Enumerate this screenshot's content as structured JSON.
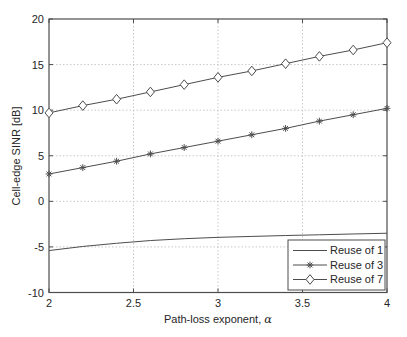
{
  "colors": {
    "background": "#ffffff",
    "line": "#4d4d4d",
    "axis": "#4d4d4d",
    "grid": "#c9c9c9",
    "text": "#262626"
  },
  "axes": {
    "xlabel_text": "Path-loss exponent,",
    "xlabel_symbol": "α",
    "ylabel": "Cell-edge SINR [dB]"
  },
  "legend": {
    "entries": [
      "Reuse of 1",
      "Reuse of 3",
      "Reuse of 7"
    ]
  },
  "chart_data": {
    "type": "line",
    "title": "",
    "xlabel": "Path-loss exponent, α",
    "ylabel": "Cell-edge SINR [dB]",
    "xlim": [
      2,
      4
    ],
    "ylim": [
      -10,
      20
    ],
    "x_tick_values": [
      2,
      2.5,
      3,
      3.5,
      4
    ],
    "x_tick_labels": [
      "2",
      "2.5",
      "3",
      "3.5",
      "4"
    ],
    "y_tick_values": [
      -10,
      -5,
      0,
      5,
      10,
      15,
      20
    ],
    "y_tick_labels": [
      "-10",
      "-5",
      "0",
      "5",
      "10",
      "15",
      "20"
    ],
    "grid": true,
    "legend_position": "bottom-right",
    "x": [
      2,
      2.2,
      2.4,
      2.6,
      2.8,
      3,
      3.2,
      3.4,
      3.6,
      3.8,
      4
    ],
    "series": [
      {
        "name": "Reuse of 1",
        "marker": "none",
        "values": [
          -5.4,
          -4.95,
          -4.6,
          -4.3,
          -4.1,
          -3.95,
          -3.85,
          -3.75,
          -3.67,
          -3.58,
          -3.5
        ]
      },
      {
        "name": "Reuse of 3",
        "marker": "asterisk",
        "values": [
          3.0,
          3.7,
          4.4,
          5.2,
          5.9,
          6.6,
          7.3,
          8.0,
          8.8,
          9.5,
          10.2
        ]
      },
      {
        "name": "Reuse of 7",
        "marker": "diamond",
        "values": [
          9.7,
          10.5,
          11.2,
          12.0,
          12.8,
          13.6,
          14.3,
          15.1,
          15.9,
          16.6,
          17.4
        ]
      }
    ]
  }
}
